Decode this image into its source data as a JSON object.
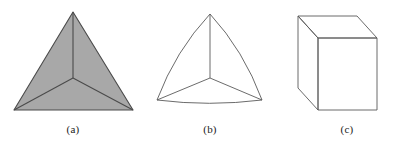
{
  "figure": {
    "background_color": "#ffffff",
    "stroke_color": "#5a5a5a",
    "dark_stroke_color": "#4a4a4a",
    "shade_fill_color": "#a8a8a8",
    "panels": [
      {
        "id": "a",
        "caption": "(a)",
        "shape_name": "shaded-triangle-tetrahedron",
        "filled": true,
        "fill_color": "#a8a8a8",
        "outer_vertices": [
          [
            73,
            12
          ],
          [
            14,
            110
          ],
          [
            133,
            110
          ]
        ],
        "center_point": [
          73,
          78
        ],
        "internal_edges": [
          [
            [
              73,
              78
            ],
            [
              73,
              12
            ]
          ],
          [
            [
              73,
              78
            ],
            [
              14,
              110
            ]
          ],
          [
            [
              73,
              78
            ],
            [
              133,
              110
            ]
          ]
        ],
        "edge_style": "straight"
      },
      {
        "id": "b",
        "caption": "(b)",
        "shape_name": "reuleaux-curved-triangle",
        "filled": false,
        "fill_color": "none",
        "outer_vertices": [
          [
            210,
            14
          ],
          [
            157,
            100
          ],
          [
            262,
            100
          ]
        ],
        "center_point": [
          210,
          78
        ],
        "internal_edges": [
          [
            [
              210,
              78
            ],
            [
              210,
              14
            ]
          ],
          [
            [
              210,
              78
            ],
            [
              157,
              100
            ]
          ],
          [
            [
              210,
              78
            ],
            [
              262,
              100
            ]
          ]
        ],
        "edge_style": "curved-outer-straight-inner"
      },
      {
        "id": "c",
        "caption": "(c)",
        "shape_name": "wireframe-cube",
        "filled": false,
        "fill_color": "none",
        "front_face": [
          [
            318,
            38
          ],
          [
            377,
            38
          ],
          [
            377,
            110
          ],
          [
            318,
            110
          ]
        ],
        "back_offset": [
          -20,
          -22
        ],
        "visible_back_vertices": [
          [
            298,
            16
          ],
          [
            357,
            16
          ],
          [
            298,
            88
          ]
        ],
        "edge_style": "straight"
      }
    ]
  },
  "captions": {
    "a": "(a)",
    "b": "(b)",
    "c": "(c)"
  }
}
